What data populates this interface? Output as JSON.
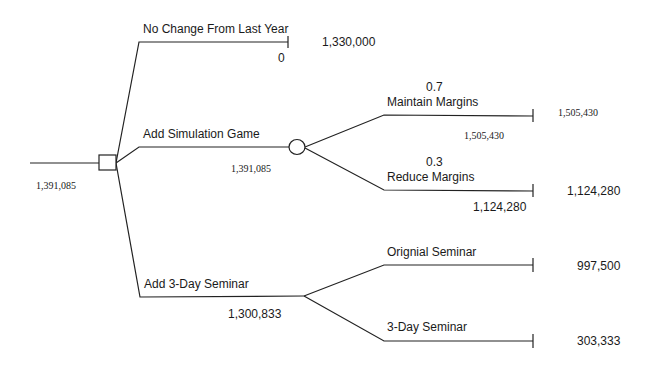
{
  "diagram": {
    "type": "decision-tree",
    "root": {
      "node_type": "decision",
      "value": "1,391,085",
      "branches": [
        {
          "label": "No Change From Last Year",
          "branch_value": "0",
          "payoff": "1,330,000"
        },
        {
          "label": "Add Simulation Game",
          "branch_value": "1,391,085",
          "node_type": "chance",
          "branches": [
            {
              "probability": "0.7",
              "label": "Maintain Margins",
              "branch_value": "1,505,430",
              "payoff": "1,505,430"
            },
            {
              "probability": "0.3",
              "label": "Reduce Margins",
              "branch_value": "1,124,280",
              "payoff": "1,124,280"
            }
          ]
        },
        {
          "label": "Add 3-Day Seminar",
          "branch_value": "1,300,833",
          "node_type": "chance",
          "branches": [
            {
              "label": "Orignial Seminar",
              "payoff": "997,500"
            },
            {
              "label": "3-Day Seminar",
              "payoff": "303,333"
            }
          ]
        }
      ]
    }
  }
}
